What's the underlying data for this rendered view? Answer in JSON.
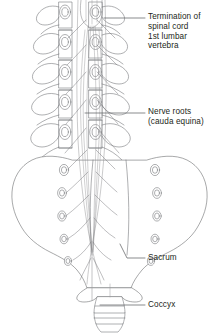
{
  "figure": {
    "background_color": "#ffffff",
    "line_color": "#58595b",
    "text_color": "#231f20",
    "width": 219,
    "height": 334
  },
  "labels": {
    "termination": "Termination of\nspinal cord\n1st lumbar\nvertebra",
    "nerve_roots": "Nerve roots\n(cauda equina)",
    "sacrum": "Sacrum",
    "coccyx": "Coccyx"
  },
  "anatomy": {
    "structures": [
      "lumbar-vertebrae",
      "spinal-cord-termination",
      "cauda-equina-nerve-roots",
      "sacrum",
      "sacral-foramina",
      "coccyx"
    ],
    "lumbar_vertebra_count": 5,
    "sacral_foramina_pairs": 5,
    "coccyx_segments": 4
  },
  "leader_lines": [
    {
      "name": "termination-leader",
      "x1": 104,
      "y1": 18,
      "x2": 145,
      "y2": 18
    },
    {
      "name": "nerve-roots-leader",
      "x1": 85,
      "y1": 113,
      "x2": 145,
      "y2": 113
    },
    {
      "name": "sacrum-leader",
      "x1": 120,
      "y1": 246,
      "x2": 145,
      "y2": 258
    },
    {
      "name": "coccyx-leader",
      "x1": 100,
      "y1": 305,
      "x2": 145,
      "y2": 305
    }
  ]
}
